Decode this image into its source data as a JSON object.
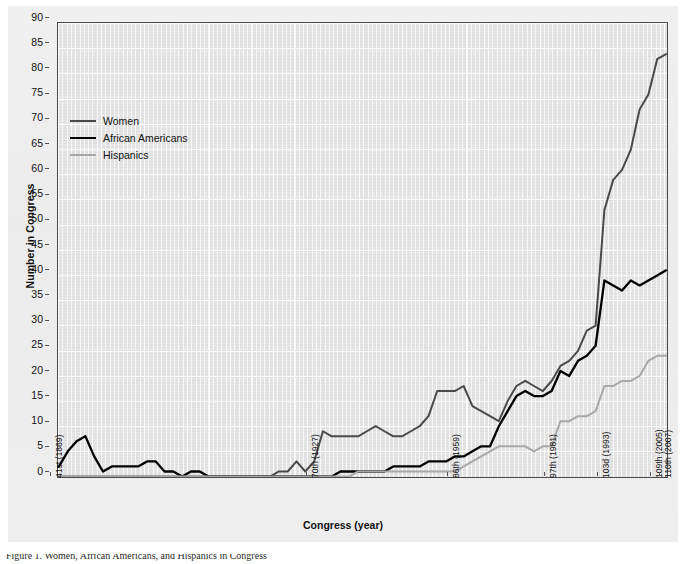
{
  "figure": {
    "y_axis_title": "Number in Congress",
    "x_axis_title": "Congress (year)",
    "caption_fragment": "Figure 1. Women, African Americans, and Hispanics in Congress",
    "colors": {
      "women": "#4a4a4a",
      "african_americans": "#000000",
      "hispanics": "#a8a8a8",
      "plot_background": "#e4e4e4",
      "gridline": "#ffffff",
      "axis": "#4a4a4a",
      "page_background": "#eeeeee"
    }
  },
  "legend": {
    "position": "top-left-inside",
    "items": [
      {
        "label": "Women",
        "color": "#4a4a4a"
      },
      {
        "label": "African Americans",
        "color": "#000000"
      },
      {
        "label": "Hispanics",
        "color": "#a8a8a8"
      }
    ]
  },
  "chart_data": {
    "type": "line",
    "title": "",
    "subtitle": "",
    "xlabel": "Congress (year)",
    "ylabel": "Number in Congress",
    "ylim": [
      0,
      90
    ],
    "ytick_step": 5,
    "yticks": [
      0,
      5,
      10,
      15,
      20,
      25,
      30,
      35,
      40,
      45,
      50,
      55,
      60,
      65,
      70,
      75,
      80,
      85,
      90
    ],
    "xlim": [
      41,
      110
    ],
    "xtick_labels": [
      "41st (1869)",
      "70th (1927)",
      "86th (1959)",
      "97th (1981)",
      "103d (1993)",
      "109th (2005)",
      "110th (2007)"
    ],
    "xtick_congress": [
      41,
      70,
      86,
      97,
      103,
      109,
      110
    ],
    "grid": true,
    "legend_position": "upper left",
    "x": [
      41,
      42,
      43,
      44,
      45,
      46,
      47,
      48,
      49,
      50,
      51,
      52,
      53,
      54,
      55,
      56,
      57,
      58,
      59,
      60,
      61,
      62,
      63,
      64,
      65,
      66,
      67,
      68,
      69,
      70,
      71,
      72,
      73,
      74,
      75,
      76,
      77,
      78,
      79,
      80,
      81,
      82,
      83,
      84,
      85,
      86,
      87,
      88,
      89,
      90,
      91,
      92,
      93,
      94,
      95,
      96,
      97,
      98,
      99,
      100,
      101,
      102,
      103,
      104,
      105,
      106,
      107,
      108,
      109,
      110
    ],
    "series": [
      {
        "name": "Women",
        "color": "#4a4a4a",
        "values": [
          0,
          0,
          0,
          0,
          0,
          0,
          0,
          0,
          0,
          0,
          0,
          0,
          0,
          0,
          0,
          0,
          0,
          0,
          0,
          0,
          0,
          0,
          0,
          0,
          0,
          1,
          1,
          3,
          1,
          3,
          9,
          8,
          8,
          8,
          8,
          9,
          10,
          9,
          8,
          8,
          9,
          10,
          12,
          17,
          17,
          17,
          18,
          14,
          13,
          12,
          11,
          15,
          18,
          19,
          18,
          17,
          19,
          22,
          23,
          25,
          29,
          30,
          53,
          59,
          61,
          65,
          73,
          76,
          83,
          84
        ]
      },
      {
        "name": "African Americans",
        "color": "#000000",
        "values": [
          2,
          5,
          7,
          8,
          4,
          1,
          2,
          2,
          2,
          2,
          3,
          3,
          1,
          1,
          0,
          1,
          1,
          0,
          0,
          0,
          0,
          0,
          0,
          0,
          0,
          0,
          0,
          0,
          0,
          0,
          0,
          0,
          1,
          1,
          1,
          1,
          1,
          1,
          2,
          2,
          2,
          2,
          3,
          3,
          3,
          4,
          4,
          5,
          6,
          6,
          10,
          13,
          16,
          17,
          16,
          16,
          17,
          21,
          20,
          23,
          24,
          26,
          39,
          38,
          37,
          39,
          38,
          39,
          40,
          41
        ]
      },
      {
        "name": "Hispanics",
        "color": "#a8a8a8",
        "values": [
          0,
          0,
          0,
          0,
          0,
          0,
          0,
          0,
          0,
          0,
          0,
          0,
          0,
          0,
          0,
          0,
          0,
          0,
          0,
          0,
          0,
          0,
          0,
          0,
          0,
          0,
          0,
          0,
          0,
          0,
          0,
          0,
          0,
          0,
          1,
          1,
          1,
          1,
          1,
          1,
          1,
          1,
          1,
          1,
          1,
          1,
          2,
          3,
          4,
          5,
          6,
          6,
          6,
          6,
          5,
          6,
          6,
          11,
          11,
          12,
          12,
          13,
          18,
          18,
          19,
          19,
          20,
          23,
          24,
          24
        ]
      }
    ]
  }
}
